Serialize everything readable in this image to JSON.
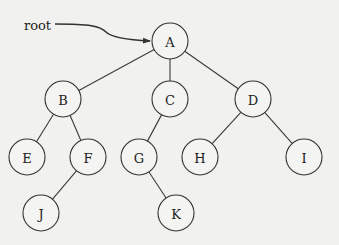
{
  "diagram": {
    "type": "binary-tree",
    "pointer_label": "root",
    "pointer_target": "A",
    "nodes": [
      {
        "id": "A",
        "label": "A",
        "x": 170,
        "y": 41
      },
      {
        "id": "B",
        "label": "B",
        "x": 63,
        "y": 99
      },
      {
        "id": "C",
        "label": "C",
        "x": 170,
        "y": 99
      },
      {
        "id": "D",
        "label": "D",
        "x": 253,
        "y": 99
      },
      {
        "id": "E",
        "label": "E",
        "x": 27,
        "y": 157
      },
      {
        "id": "F",
        "label": "F",
        "x": 88,
        "y": 157
      },
      {
        "id": "G",
        "label": "G",
        "x": 139,
        "y": 157
      },
      {
        "id": "H",
        "label": "H",
        "x": 200,
        "y": 157
      },
      {
        "id": "I",
        "label": "I",
        "x": 304,
        "y": 157
      },
      {
        "id": "J",
        "label": "J",
        "x": 41,
        "y": 213
      },
      {
        "id": "K",
        "label": "K",
        "x": 176,
        "y": 213
      }
    ],
    "edges": [
      [
        "A",
        "B"
      ],
      [
        "A",
        "C"
      ],
      [
        "A",
        "D"
      ],
      [
        "B",
        "E"
      ],
      [
        "B",
        "F"
      ],
      [
        "C",
        "G"
      ],
      [
        "D",
        "H"
      ],
      [
        "D",
        "I"
      ],
      [
        "F",
        "J"
      ],
      [
        "G",
        "K"
      ]
    ],
    "node_radius": 18
  }
}
